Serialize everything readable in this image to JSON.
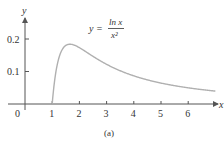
{
  "chart_data": {
    "type": "line",
    "title": "",
    "equation_label": {
      "lhs": "y =",
      "numerator": "ln x",
      "denominator": "x²"
    },
    "xlabel": "x",
    "ylabel": "y",
    "caption": "(a)",
    "x_ticks": [
      1,
      2,
      3,
      4,
      5,
      6
    ],
    "x_tick_labels": [
      "1",
      "2",
      "3",
      "4",
      "5",
      "6"
    ],
    "y_ticks": [
      0.1,
      0.2
    ],
    "y_tick_labels": [
      "0.1",
      "0.2"
    ],
    "origin_label": "0",
    "xlim": [
      0,
      7
    ],
    "ylim": [
      0,
      0.25
    ],
    "grid": false,
    "series": [
      {
        "name": "y = ln x / x^2",
        "function": "ln(x)/x^2",
        "x": [
          1.0,
          1.2,
          1.4,
          1.65,
          2.0,
          2.5,
          3.0,
          3.5,
          4.0,
          4.5,
          5.0,
          5.5,
          6.0,
          6.5,
          7.0
        ],
        "values": [
          0.0,
          0.127,
          0.172,
          0.184,
          0.173,
          0.147,
          0.122,
          0.102,
          0.087,
          0.074,
          0.064,
          0.056,
          0.05,
          0.044,
          0.04
        ],
        "color": "#b0b0b0"
      }
    ]
  },
  "colors": {
    "axis": "#555555",
    "curve": "#b0b0b0",
    "text": "#333333"
  }
}
